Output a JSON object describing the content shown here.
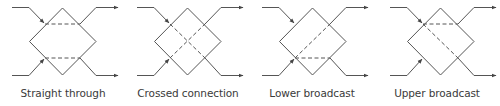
{
  "figure": {
    "line_color": "#555555",
    "label_color": "#3a3a3a",
    "panels": [
      {
        "id": "straight",
        "label": "Straight through",
        "offset_x": 0,
        "label_x": 63,
        "internal": [
          {
            "from": "UL",
            "to": "UR"
          },
          {
            "from": "LL",
            "to": "LR"
          }
        ]
      },
      {
        "id": "crossed",
        "label": "Crossed connection",
        "offset_x": 125,
        "label_x": 188,
        "internal": [
          {
            "from": "UL",
            "to": "LR"
          },
          {
            "from": "LL",
            "to": "UR"
          }
        ]
      },
      {
        "id": "lower",
        "label": "Lower broadcast",
        "offset_x": 250,
        "label_x": 312,
        "internal": [
          {
            "from": "LL",
            "to": "UR"
          },
          {
            "from": "LL",
            "to": "LR"
          }
        ]
      },
      {
        "id": "upper",
        "label": "Upper broadcast",
        "offset_x": 378,
        "label_x": 437,
        "internal": [
          {
            "from": "UL",
            "to": "UR"
          },
          {
            "from": "UL",
            "to": "LR"
          }
        ]
      }
    ]
  }
}
